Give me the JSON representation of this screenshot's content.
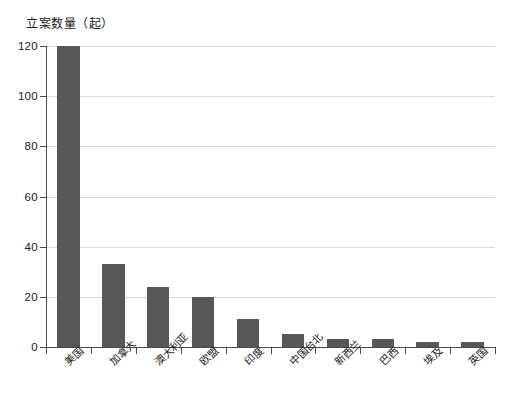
{
  "chart_data": {
    "type": "bar",
    "title": "",
    "subtitle": "",
    "xlabel": "",
    "ylabel": "立案数量（起）",
    "ylim": [
      0,
      120
    ],
    "ytick_values": [
      0,
      20,
      40,
      60,
      80,
      100,
      120
    ],
    "ytick_labels": [
      "0",
      "20",
      "40",
      "60",
      "80",
      "100",
      "120"
    ],
    "grid": true,
    "grid_axis": "y",
    "legend": false,
    "legend_position": "none",
    "bar_color": "#585858",
    "axis_color": "#4a4a4a",
    "gridline_color": "#d9d9d9",
    "background_color": "#ffffff",
    "categories": [
      "美国",
      "加拿大",
      "澳大利亚",
      "欧盟",
      "印度",
      "中国台北",
      "新西兰",
      "巴西",
      "埃及",
      "英国"
    ],
    "values": [
      120,
      33,
      24,
      20,
      11,
      5,
      3,
      3,
      2,
      2
    ],
    "annotations": []
  }
}
